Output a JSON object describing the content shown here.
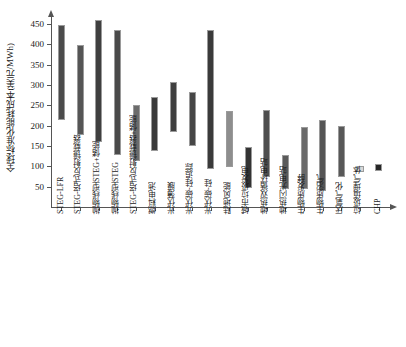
{
  "chart_data": {
    "type": "bar",
    "subtype": "range-bar",
    "title": "",
    "xlabel": "",
    "ylabel": "全球标准化能耗成本(美元/MWh)",
    "ylim": [
      0,
      465
    ],
    "ytick_labels": [
      "50",
      "100",
      "150",
      "200",
      "250",
      "300",
      "350",
      "400",
      "450"
    ],
    "ytick_values": [
      50,
      100,
      150,
      200,
      250,
      300,
      350,
      400,
      450
    ],
    "grid": false,
    "legend": false,
    "categories": [
      "STEG-LFR",
      "STEG-塔式反射镜载器",
      "抛物线型STEG+储能",
      "抛物线型STEG",
      "STEG-塔式反射镜载器+储能",
      "燃料电池",
      "光伏薄膜",
      "光伏碳-硅追踪",
      "光伏碳-硅",
      "陆地风能",
      "城市垃圾发电",
      "地热双循环电站",
      "地热闪光电站",
      "生物质发酵",
      "生物质沼气",
      "厌氧气化",
      "垃圾填埋气体",
      "CHP"
    ],
    "low": [
      213,
      176,
      160,
      129,
      112,
      138,
      185,
      150,
      94,
      98,
      47,
      73,
      45,
      45,
      40,
      73,
      86,
      88
    ],
    "high": [
      447,
      398,
      461,
      435,
      251,
      271,
      307,
      283,
      435,
      235,
      148,
      238,
      128,
      197,
      213,
      199,
      101,
      105
    ],
    "bar_colors": [
      "#4b4b4b",
      "#555555",
      "#3f3f3f",
      "#4a4a4a",
      "#6b6b6b",
      "#3a3a3a",
      "#3f3f3f",
      "#464646",
      "#3a3a3a",
      "#8e8e8e",
      "#333333",
      "#4e4e4e",
      "#5a5a5a",
      "#6a6a6a",
      "#555555",
      "#585858",
      "#d8d8d8",
      "#262626"
    ],
    "unit": "美元/MWh"
  },
  "axis": {
    "y_axis_name": "y-axis",
    "x_axis_name": "x-axis"
  }
}
